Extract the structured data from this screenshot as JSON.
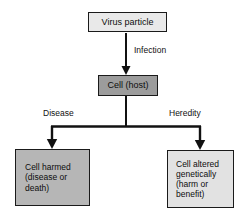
{
  "diagram": {
    "background_color": "#ffffff",
    "line_color": "#111111",
    "nodes": {
      "virus": {
        "label": "Virus particle",
        "fill": "#e9e9e9"
      },
      "host": {
        "label": "Cell (host)",
        "fill": "#9c9c9c"
      },
      "harmed": {
        "label": "Cell harmed\n(disease or\ndeath)",
        "fill": "#b6b6b6"
      },
      "altered": {
        "label": "Cell altered\ngenetically\n(harm or\nbenefit)",
        "fill": "#e2e2e2"
      }
    },
    "edge_labels": {
      "infection": "Infection",
      "disease": "Disease",
      "heredity": "Heredity"
    }
  }
}
